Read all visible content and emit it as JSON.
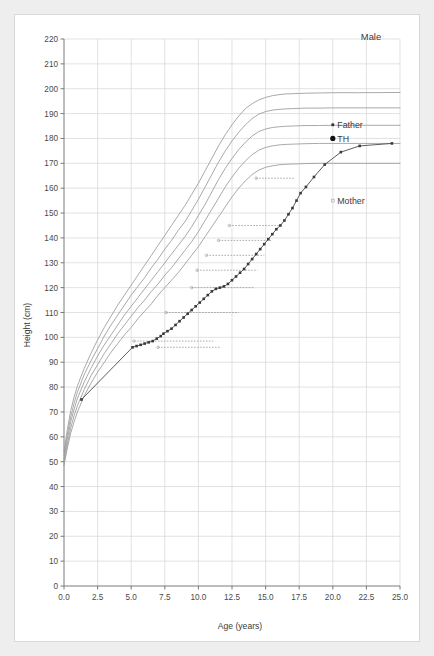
{
  "figure": {
    "background_color": "#eeeeee",
    "panel_color": "#ffffff",
    "sex_label": "Male"
  },
  "chart_data": {
    "type": "line",
    "title": "Male",
    "xlabel": "Age (years)",
    "ylabel": "Height (cm)",
    "xlim": [
      0.0,
      25.0
    ],
    "ylim": [
      0,
      220
    ],
    "xticks": [
      "0.0",
      "2.5",
      "5.0",
      "7.5",
      "10.0",
      "12.5",
      "15.0",
      "17.5",
      "20.0",
      "22.5",
      "25.0"
    ],
    "xtick_values": [
      0.0,
      2.5,
      5.0,
      7.5,
      10.0,
      12.5,
      15.0,
      17.5,
      20.0,
      22.5,
      25.0
    ],
    "yticks": [
      "0",
      "10",
      "20",
      "30",
      "40",
      "50",
      "60",
      "70",
      "80",
      "90",
      "100",
      "110",
      "120",
      "130",
      "140",
      "150",
      "160",
      "170",
      "180",
      "190",
      "200",
      "210",
      "220"
    ],
    "ytick_values": [
      0,
      10,
      20,
      30,
      40,
      50,
      60,
      70,
      80,
      90,
      100,
      110,
      120,
      130,
      140,
      150,
      160,
      170,
      180,
      190,
      200,
      210,
      220
    ],
    "grid": true,
    "grid_color": "#d6d6d6",
    "reference_curve_color": "#9a9a9a",
    "patient_curve_color": "#4a4a4a",
    "legend_position": "none",
    "series": [
      {
        "name": "centile-97",
        "kind": "reference",
        "x": [
          0.0,
          0.25,
          0.5,
          0.75,
          1.0,
          1.5,
          2.0,
          2.5,
          3.0,
          3.5,
          4.0,
          4.5,
          5.0,
          5.5,
          6.0,
          6.5,
          7.0,
          7.5,
          8.0,
          8.5,
          9.0,
          9.5,
          10.0,
          10.5,
          11.0,
          11.5,
          12.0,
          12.5,
          13.0,
          13.5,
          14.0,
          14.5,
          15.0,
          15.5,
          16.0,
          16.5,
          17.0,
          17.5,
          18.0,
          19.0,
          20.0,
          22.0,
          25.0
        ],
        "values": [
          54.0,
          63.0,
          70.5,
          76.0,
          80.5,
          87.5,
          93.5,
          99.0,
          104.0,
          108.5,
          113.0,
          117.0,
          121.0,
          125.0,
          129.0,
          133.0,
          137.0,
          141.0,
          145.0,
          149.0,
          153.0,
          157.5,
          162.0,
          167.0,
          172.0,
          177.0,
          181.5,
          185.5,
          189.0,
          192.0,
          194.0,
          195.5,
          196.5,
          197.2,
          197.6,
          197.9,
          198.0,
          198.1,
          198.2,
          198.3,
          198.4,
          198.4,
          198.5
        ]
      },
      {
        "name": "centile-90",
        "kind": "reference",
        "x": [
          0.0,
          0.25,
          0.5,
          0.75,
          1.0,
          1.5,
          2.0,
          2.5,
          3.0,
          3.5,
          4.0,
          4.5,
          5.0,
          5.5,
          6.0,
          6.5,
          7.0,
          7.5,
          8.0,
          8.5,
          9.0,
          9.5,
          10.0,
          10.5,
          11.0,
          11.5,
          12.0,
          12.5,
          13.0,
          13.5,
          14.0,
          14.5,
          15.0,
          15.5,
          16.0,
          16.5,
          17.0,
          17.5,
          18.0,
          19.0,
          20.0,
          22.0,
          25.0
        ],
        "values": [
          52.5,
          61.0,
          68.0,
          73.5,
          78.0,
          85.0,
          90.5,
          95.5,
          100.5,
          105.0,
          109.0,
          113.0,
          117.0,
          120.5,
          124.0,
          128.0,
          131.5,
          135.5,
          139.0,
          143.0,
          146.5,
          151.0,
          155.5,
          160.5,
          165.5,
          170.5,
          175.0,
          179.0,
          182.5,
          185.5,
          188.0,
          189.8,
          190.8,
          191.4,
          191.7,
          191.9,
          192.0,
          192.1,
          192.2,
          192.2,
          192.3,
          192.3,
          192.3
        ]
      },
      {
        "name": "centile-50",
        "kind": "reference",
        "x": [
          0.0,
          0.25,
          0.5,
          0.75,
          1.0,
          1.5,
          2.0,
          2.5,
          3.0,
          3.5,
          4.0,
          4.5,
          5.0,
          5.5,
          6.0,
          6.5,
          7.0,
          7.5,
          8.0,
          8.5,
          9.0,
          9.5,
          10.0,
          10.5,
          11.0,
          11.5,
          12.0,
          12.5,
          13.0,
          13.5,
          14.0,
          14.5,
          15.0,
          15.5,
          16.0,
          16.5,
          17.0,
          17.5,
          18.0,
          19.0,
          20.0,
          22.0,
          25.0
        ],
        "values": [
          51.0,
          59.0,
          66.0,
          71.0,
          75.5,
          82.0,
          87.5,
          92.5,
          97.0,
          101.0,
          105.0,
          109.0,
          112.5,
          116.0,
          119.5,
          123.0,
          126.5,
          130.0,
          133.5,
          137.0,
          140.5,
          144.5,
          149.0,
          153.5,
          158.5,
          163.5,
          168.0,
          172.0,
          175.5,
          178.5,
          181.0,
          182.8,
          183.8,
          184.4,
          184.7,
          184.9,
          185.0,
          185.1,
          185.2,
          185.2,
          185.3,
          185.3,
          185.3
        ]
      },
      {
        "name": "centile-10",
        "kind": "reference",
        "x": [
          0.0,
          0.25,
          0.5,
          0.75,
          1.0,
          1.5,
          2.0,
          2.5,
          3.0,
          3.5,
          4.0,
          4.5,
          5.0,
          5.5,
          6.0,
          6.5,
          7.0,
          7.5,
          8.0,
          8.5,
          9.0,
          9.5,
          10.0,
          10.5,
          11.0,
          11.5,
          12.0,
          12.5,
          13.0,
          13.5,
          14.0,
          14.5,
          15.0,
          15.5,
          16.0,
          16.5,
          17.0,
          17.5,
          18.0,
          19.0,
          20.0,
          22.0,
          25.0
        ],
        "values": [
          49.5,
          57.0,
          63.5,
          68.5,
          72.5,
          79.0,
          84.5,
          89.0,
          93.5,
          97.5,
          101.5,
          105.0,
          108.5,
          112.0,
          115.0,
          118.5,
          121.5,
          125.0,
          128.0,
          131.5,
          135.0,
          138.5,
          142.5,
          147.0,
          151.5,
          156.0,
          160.5,
          164.5,
          168.0,
          171.0,
          173.5,
          175.3,
          176.4,
          177.0,
          177.4,
          177.6,
          177.7,
          177.8,
          177.9,
          178.0,
          178.0,
          178.0,
          178.0
        ]
      },
      {
        "name": "centile-3",
        "kind": "reference",
        "x": [
          0.0,
          0.25,
          0.5,
          0.75,
          1.0,
          1.5,
          2.0,
          2.5,
          3.0,
          3.5,
          4.0,
          4.5,
          5.0,
          5.5,
          6.0,
          6.5,
          7.0,
          7.5,
          8.0,
          8.5,
          9.0,
          9.5,
          10.0,
          10.5,
          11.0,
          11.5,
          12.0,
          12.5,
          13.0,
          13.5,
          14.0,
          14.5,
          15.0,
          15.5,
          16.0,
          16.5,
          17.0,
          17.5,
          18.0,
          19.0,
          20.0,
          22.0,
          25.0
        ],
        "values": [
          48.5,
          55.5,
          61.5,
          66.0,
          70.0,
          76.5,
          81.5,
          86.0,
          90.0,
          94.0,
          97.5,
          101.0,
          104.0,
          107.5,
          110.5,
          113.5,
          117.0,
          120.0,
          123.0,
          126.0,
          129.5,
          133.0,
          136.5,
          140.5,
          144.5,
          148.5,
          152.5,
          156.5,
          160.0,
          163.0,
          165.5,
          167.3,
          168.4,
          169.0,
          169.4,
          169.6,
          169.7,
          169.8,
          169.9,
          170.0,
          170.0,
          170.0,
          170.0
        ]
      },
      {
        "name": "patient-height",
        "kind": "measurement",
        "x": [
          1.3,
          5.1,
          5.4,
          5.7,
          6.0,
          6.3,
          6.6,
          6.9,
          7.2,
          7.4,
          7.7,
          8.0,
          8.3,
          8.6,
          8.9,
          9.2,
          9.5,
          9.8,
          10.1,
          10.4,
          10.7,
          11.0,
          11.3,
          11.6,
          11.9,
          12.2,
          12.5,
          12.8,
          13.1,
          13.4,
          13.7,
          14.0,
          14.3,
          14.6,
          14.9,
          15.2,
          15.5,
          15.8,
          16.1,
          16.4,
          16.7,
          17.0,
          17.3,
          17.6,
          18.0,
          18.6,
          19.4,
          20.6,
          22.0,
          24.4
        ],
        "values": [
          75.0,
          96.0,
          96.5,
          97.0,
          97.5,
          98.0,
          98.5,
          99.5,
          100.5,
          101.5,
          102.5,
          103.5,
          105.0,
          106.5,
          108.0,
          109.5,
          111.0,
          112.5,
          114.0,
          115.5,
          117.0,
          118.5,
          119.5,
          120.0,
          120.5,
          121.5,
          123.0,
          124.5,
          126.0,
          127.5,
          129.5,
          131.5,
          133.5,
          135.5,
          137.5,
          139.5,
          141.5,
          143.5,
          145.0,
          147.0,
          149.5,
          152.0,
          155.0,
          158.0,
          160.5,
          164.5,
          169.5,
          174.5,
          177.0,
          178.0
        ]
      }
    ],
    "annotations": [
      {
        "name": "father-height",
        "label": "Father",
        "x": 20.0,
        "y": 185.5,
        "marker": "small-square"
      },
      {
        "name": "target-height",
        "label": "TH",
        "x": 20.0,
        "y": 180.0,
        "marker": "large-dot"
      },
      {
        "name": "mother-height",
        "label": "Mother",
        "x": 20.0,
        "y": 155.0,
        "marker": "small-open-square"
      }
    ],
    "reference_dashed_lines": [
      {
        "y": 96.0,
        "x1": 7.0,
        "x2": 11.6
      },
      {
        "y": 98.5,
        "x1": 5.2,
        "x2": 11.1
      },
      {
        "y": 110.0,
        "x1": 7.6,
        "x2": 13.0
      },
      {
        "y": 120.0,
        "x1": 9.5,
        "x2": 14.1
      },
      {
        "y": 127.0,
        "x1": 9.9,
        "x2": 14.4
      },
      {
        "y": 133.0,
        "x1": 10.6,
        "x2": 14.9
      },
      {
        "y": 139.0,
        "x1": 11.5,
        "x2": 15.5
      },
      {
        "y": 145.0,
        "x1": 12.3,
        "x2": 16.0
      },
      {
        "y": 164.0,
        "x1": 14.3,
        "x2": 17.2
      }
    ]
  }
}
